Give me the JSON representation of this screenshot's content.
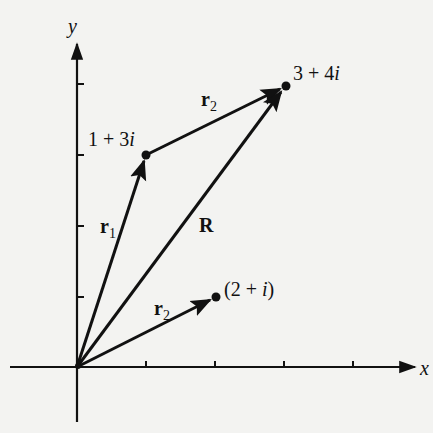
{
  "figure": {
    "type": "complex-plane-vector-addition",
    "axes": {
      "x_label": "x",
      "y_label": "y",
      "x_ticks": [
        1,
        2,
        3,
        4
      ],
      "y_ticks": [
        1,
        2,
        3,
        4
      ]
    },
    "points": [
      {
        "id": "p1",
        "label_pre": "1 + 3",
        "label_i": "i",
        "re": 1,
        "im": 3
      },
      {
        "id": "p2",
        "label_pre": "3 + 4",
        "label_i": "i",
        "re": 3,
        "im": 4
      },
      {
        "id": "p3",
        "label_open": "(2 + ",
        "label_i": "i",
        "label_close": ")",
        "re": 2,
        "im": 1
      }
    ],
    "vectors": [
      {
        "name": "r",
        "sub": "1",
        "from": [
          0,
          0
        ],
        "to": [
          1,
          3
        ]
      },
      {
        "name": "r",
        "sub": "2",
        "from": [
          1,
          3
        ],
        "to": [
          3,
          4
        ]
      },
      {
        "name": "R",
        "sub": "",
        "from": [
          0,
          0
        ],
        "to": [
          3,
          4
        ]
      },
      {
        "name": "r",
        "sub": "2",
        "from": [
          0,
          0
        ],
        "to": [
          2,
          1
        ]
      }
    ],
    "labels": {
      "r1_main": "r",
      "r1_sub": "1",
      "r2_top_main": "r",
      "r2_top_sub": "2",
      "R": "R",
      "r2_bottom_main": "r",
      "r2_bottom_sub": "2"
    },
    "colors": {
      "ink": "#111111",
      "paper": "#f3f3f1"
    }
  }
}
